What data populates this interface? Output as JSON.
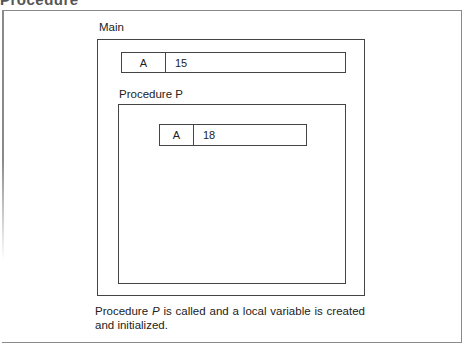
{
  "figure": {
    "top_cut_text": "Procedure",
    "main": {
      "label": "Main",
      "variable": {
        "name": "A",
        "value": "15"
      }
    },
    "procedure": {
      "label": "Procedure P",
      "variable": {
        "name": "A",
        "value": "18"
      }
    },
    "caption": {
      "part1": "Procedure ",
      "italic": "P",
      "part2": " is called and a local variable is created and initialized."
    }
  }
}
